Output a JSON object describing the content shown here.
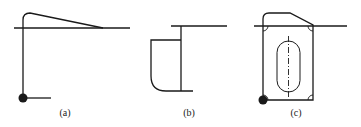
{
  "figure": {
    "panels": [
      {
        "id": "a",
        "label": "(a)"
      },
      {
        "id": "b",
        "label": "(b)"
      },
      {
        "id": "c",
        "label": "(c)"
      }
    ]
  },
  "colors": {
    "stroke": "#1a1a1a",
    "background": "#ffffff"
  }
}
